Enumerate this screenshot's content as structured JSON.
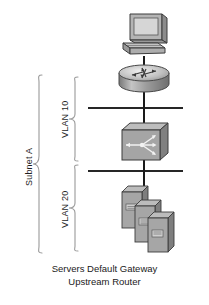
{
  "diagram": {
    "caption": {
      "line1": "Servers Default Gateway",
      "line2": "Upstream Router"
    },
    "nodes": [
      {
        "id": "workstation",
        "icon": "workstation-icon",
        "label": ""
      },
      {
        "id": "router",
        "icon": "router-icon",
        "label": ""
      },
      {
        "id": "switch",
        "icon": "switch-icon",
        "label": ""
      },
      {
        "id": "servers",
        "icon": "server-stack-icon",
        "label": ""
      }
    ],
    "braces": [
      {
        "id": "subnet-a",
        "label": "Subnet A"
      },
      {
        "id": "vlan-10",
        "label": "VLAN 10"
      },
      {
        "id": "vlan-20",
        "label": "VLAN 20"
      }
    ],
    "colors": {
      "line": "#262626",
      "device_light": "#d8d8d8",
      "device_mid": "#a8a8a8",
      "device_dark": "#7a7a7a",
      "screen": "#c9c9c9",
      "text": "#1a1a1a",
      "brace": "#8a8a8a",
      "background": "#ffffff"
    }
  }
}
